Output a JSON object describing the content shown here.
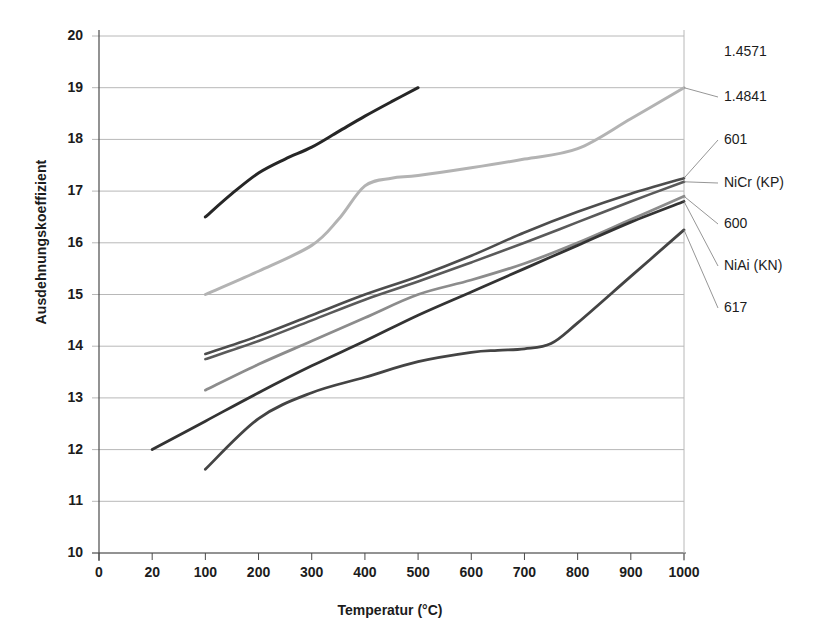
{
  "chart_data": {
    "type": "line",
    "title": "",
    "xlabel": "Temperatur (°C)",
    "ylabel": "Ausdehnungskoeffizient",
    "xlim": [
      0,
      1000
    ],
    "ylim": [
      10,
      20
    ],
    "grid": true,
    "legend_position": "right-outside-labels",
    "x_ticks": [
      "0",
      "20",
      "100",
      "200",
      "300",
      "400",
      "500",
      "600",
      "700",
      "800",
      "900",
      "1000"
    ],
    "x_tick_values": [
      0,
      20,
      100,
      200,
      300,
      400,
      500,
      600,
      700,
      800,
      900,
      1000
    ],
    "y_ticks": [
      "10",
      "11",
      "12",
      "13",
      "14",
      "15",
      "16",
      "17",
      "18",
      "19",
      "20"
    ],
    "y_tick_values": [
      10,
      11,
      12,
      13,
      14,
      15,
      16,
      17,
      18,
      19,
      20
    ],
    "series": [
      {
        "name": "1.4571",
        "color": "#262626",
        "width": 3.0,
        "x": [
          100,
          150,
          200,
          250,
          300,
          350,
          400,
          450,
          500
        ],
        "y": [
          16.5,
          16.95,
          17.35,
          17.62,
          17.85,
          18.15,
          18.45,
          18.73,
          19.0
        ]
      },
      {
        "name": "1.4841",
        "color": "#b3b3b3",
        "width": 3.0,
        "x": [
          100,
          200,
          300,
          350,
          400,
          450,
          500,
          600,
          700,
          800,
          900,
          1000
        ],
        "y": [
          15.0,
          15.45,
          15.95,
          16.45,
          17.1,
          17.25,
          17.3,
          17.45,
          17.62,
          17.82,
          18.4,
          19.0
        ]
      },
      {
        "name": "601",
        "color": "#4d4d4d",
        "width": 2.6,
        "x": [
          100,
          200,
          300,
          400,
          500,
          600,
          700,
          800,
          900,
          1000
        ],
        "y": [
          13.85,
          14.2,
          14.6,
          15.0,
          15.35,
          15.75,
          16.2,
          16.6,
          16.95,
          17.25
        ]
      },
      {
        "name": "NiCr (KP)",
        "color": "#5a5a5a",
        "width": 2.6,
        "x": [
          100,
          200,
          300,
          400,
          500,
          600,
          700,
          800,
          900,
          1000
        ],
        "y": [
          13.75,
          14.1,
          14.5,
          14.9,
          15.25,
          15.62,
          16.0,
          16.4,
          16.8,
          17.18
        ]
      },
      {
        "name": "600",
        "color": "#8c8c8c",
        "width": 2.8,
        "x": [
          100,
          200,
          300,
          400,
          500,
          600,
          700,
          800,
          900,
          1000
        ],
        "y": [
          13.15,
          13.65,
          14.1,
          14.55,
          15.0,
          15.28,
          15.6,
          16.0,
          16.45,
          16.9
        ]
      },
      {
        "name": "NiAi (KN)",
        "color": "#333333",
        "width": 2.8,
        "x": [
          20,
          100,
          200,
          300,
          400,
          500,
          600,
          700,
          800,
          900,
          1000
        ],
        "y": [
          12.0,
          12.55,
          13.1,
          13.62,
          14.1,
          14.6,
          15.05,
          15.5,
          15.95,
          16.4,
          16.8
        ]
      },
      {
        "name": "617",
        "color": "#444444",
        "width": 2.8,
        "x": [
          100,
          200,
          300,
          400,
          500,
          600,
          650,
          700,
          750,
          800,
          900,
          1000
        ],
        "y": [
          11.62,
          12.6,
          13.1,
          13.4,
          13.7,
          13.88,
          13.92,
          13.95,
          14.05,
          14.45,
          15.35,
          16.25
        ]
      }
    ],
    "callouts": [
      {
        "label": "1.4571",
        "leader": false
      },
      {
        "label": "1.4841",
        "leader": true
      },
      {
        "label": "601",
        "leader": true
      },
      {
        "label": "NiCr (KP)",
        "leader": true
      },
      {
        "label": "600",
        "leader": true
      },
      {
        "label": "NiAi (KN)",
        "leader": true
      },
      {
        "label": "617",
        "leader": true
      }
    ],
    "label_positions": [
      {
        "label": "1.4571",
        "x": 724,
        "y": 52
      },
      {
        "label": "1.4841",
        "x": 724,
        "y": 97
      },
      {
        "label": "601",
        "x": 724,
        "y": 140
      },
      {
        "label": "NiCr (KP)",
        "x": 724,
        "y": 183
      },
      {
        "label": "600",
        "x": 724,
        "y": 224
      },
      {
        "label": "NiAi (KN)",
        "x": 724,
        "y": 266
      },
      {
        "label": "617",
        "x": 724,
        "y": 308
      }
    ],
    "colors": {
      "axis": "#4a4a4a",
      "grid": "#b8b8b8",
      "text": "#1c1c1c",
      "background": "#ffffff"
    }
  }
}
